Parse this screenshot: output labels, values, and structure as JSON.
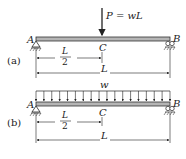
{
  "figure_a": {
    "tag": "(a)",
    "load_label": "P = wL",
    "left_support": "A",
    "right_support": "B",
    "midpoint": "C",
    "half_span_num": "L",
    "half_span_den": "2",
    "span": "L"
  },
  "figure_b": {
    "tag": "(b)",
    "load_label": "w",
    "left_support": "A",
    "right_support": "B",
    "midpoint": "C",
    "half_span_num": "L",
    "half_span_den": "2",
    "span": "L",
    "arrow_count": 18
  },
  "colors": {
    "beam_fill": "#b5b5b5",
    "ink": "#222222"
  }
}
